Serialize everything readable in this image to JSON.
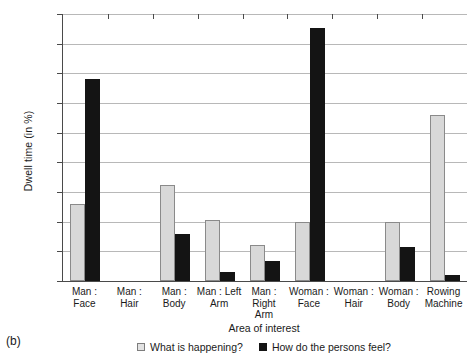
{
  "panel_caption": "(b)",
  "legend": {
    "entries": [
      {
        "label": "What is happening?",
        "swatch": "light",
        "color": "#e2e2e2"
      },
      {
        "label": "How do the persons feel?",
        "swatch": "dark",
        "color": "#141414"
      }
    ]
  },
  "chart_data": {
    "type": "bar",
    "title": "",
    "xlabel": "Area of interest",
    "ylabel": "Dwell time (in %)",
    "ylim": [
      0,
      45
    ],
    "yticks": [
      0,
      5,
      10,
      15,
      20,
      25,
      30,
      35,
      40,
      45
    ],
    "ytick_labels": [
      "0",
      "5",
      "10",
      "15",
      "20",
      "25",
      "30",
      "35",
      "40",
      "45"
    ],
    "grid": true,
    "grid_axis": "y",
    "legend_position": "below",
    "categories": [
      "Man : Face",
      "Man : Hair",
      "Man : Body",
      "Man : Left Arm",
      "Man : Right Arm",
      "Woman : Face",
      "Woman : Hair",
      "Woman : Body",
      "Rowing Machine"
    ],
    "category_label_lines": [
      [
        "Man : Face"
      ],
      [
        "Man : Hair"
      ],
      [
        "Man : Body"
      ],
      [
        "Man : Left",
        "Arm"
      ],
      [
        "Man : Right",
        "Arm"
      ],
      [
        "Woman :",
        "Face"
      ],
      [
        "Woman :",
        "Hair"
      ],
      [
        "Woman :",
        "Body"
      ],
      [
        "Rowing",
        "Machine"
      ]
    ],
    "series": [
      {
        "name": "What is happening?",
        "color": "#d8d8d8",
        "values": [
          13.0,
          0,
          16.1,
          10.3,
          6.0,
          10.0,
          0,
          10.0,
          27.9
        ]
      },
      {
        "name": "How do the persons feel?",
        "color": "#141414",
        "values": [
          34.1,
          0,
          8.0,
          1.5,
          3.3,
          42.7,
          0,
          5.7,
          1.0
        ]
      }
    ]
  }
}
